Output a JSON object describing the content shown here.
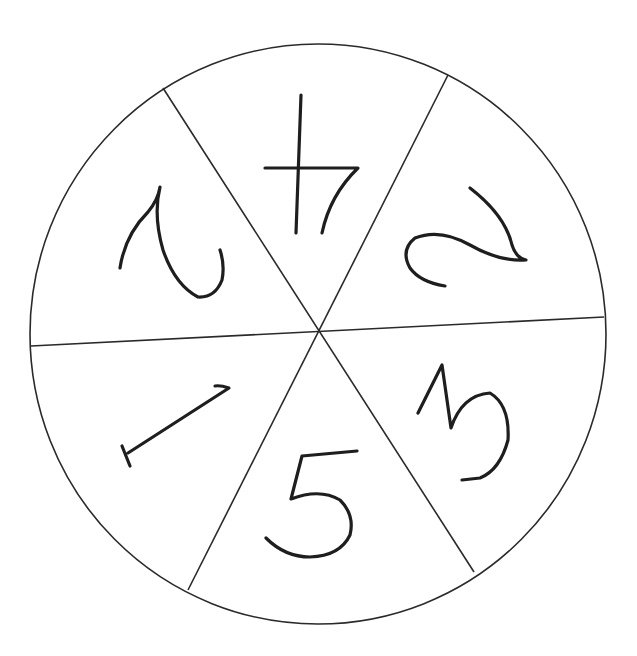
{
  "diagram": {
    "type": "spinner",
    "section_count": 6,
    "colors": {
      "line": "#2a2a2a",
      "ink": "#1e1e1e",
      "background": "#ffffff"
    },
    "sections": [
      {
        "id": "top",
        "value": "4",
        "orientation": "upside-down"
      },
      {
        "id": "upper-right",
        "value": "2",
        "orientation": "rotated"
      },
      {
        "id": "lower-right",
        "value": "3",
        "orientation": "rotated"
      },
      {
        "id": "bottom",
        "value": "5",
        "orientation": "upright"
      },
      {
        "id": "lower-left",
        "value": "1",
        "orientation": "rotated"
      },
      {
        "id": "upper-left",
        "value": "2",
        "orientation": "rotated"
      }
    ]
  }
}
